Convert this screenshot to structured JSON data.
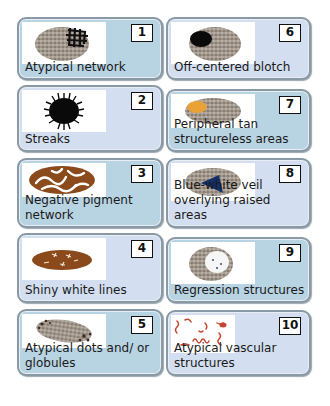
{
  "colors": {
    "card_blue": "#b8d3e2",
    "card_pale": "#d3dff0",
    "border": "#8a99a6",
    "lesion_gray": "#9b8f84",
    "lesion_dark": "#1a1a1a",
    "tan": "#e8a236",
    "brown": "#8a4a1c",
    "veil_blue": "#14306b",
    "vessel_red": "#c5452e"
  },
  "cards": [
    {
      "number": "1",
      "label": "Atypical network",
      "icon": "atypical-network-icon"
    },
    {
      "number": "2",
      "label": "Streaks",
      "icon": "streaks-icon"
    },
    {
      "number": "3",
      "label": "Negative pigment network",
      "icon": "negative-network-icon"
    },
    {
      "number": "4",
      "label": "Shiny white lines",
      "icon": "shiny-white-lines-icon"
    },
    {
      "number": "5",
      "label": "Atypical dots and/ or globules",
      "icon": "dots-globules-icon"
    },
    {
      "number": "6",
      "label": "Off-centered blotch",
      "icon": "blotch-icon"
    },
    {
      "number": "7",
      "label": "Peripheral tan structureless areas",
      "icon": "tan-areas-icon"
    },
    {
      "number": "8",
      "label": "Blue-white veil overlying raised areas",
      "icon": "blue-white-veil-icon"
    },
    {
      "number": "9",
      "label": "Regression structures",
      "icon": "regression-icon"
    },
    {
      "number": "10",
      "label": "Atypical vascular structures",
      "icon": "vascular-icon"
    }
  ]
}
